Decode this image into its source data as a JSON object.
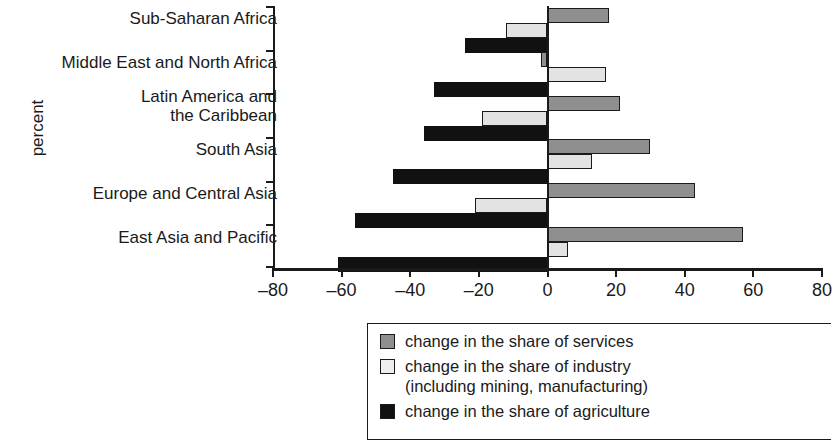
{
  "chart_data": {
    "type": "bar",
    "orientation": "horizontal",
    "title": "",
    "xlabel": "",
    "ylabel": "percent",
    "xlim": [
      -80,
      80
    ],
    "xticks": [
      -80,
      -60,
      -40,
      -20,
      0,
      20,
      40,
      60,
      80
    ],
    "xticklabels": [
      "–80",
      "–60",
      "–40",
      "–20",
      "0",
      "20",
      "40",
      "60",
      "80"
    ],
    "grid": false,
    "legend_position": "bottom",
    "categories": [
      "Sub-Saharan Africa",
      "Middle East and North Africa",
      "Latin America and\nthe Caribbean",
      "South Asia",
      "Europe and Central Asia",
      "East Asia and Pacific"
    ],
    "category_lines": [
      [
        "Sub-Saharan Africa"
      ],
      [
        "Middle East and North Africa"
      ],
      [
        "Latin America and",
        "the Caribbean"
      ],
      [
        "South Asia"
      ],
      [
        "Europe and Central Asia"
      ],
      [
        "East Asia and Pacific"
      ]
    ],
    "series": [
      {
        "name": "change in the share of services",
        "color": "#8f8f8f",
        "values": [
          18,
          -2,
          21,
          30,
          43,
          57
        ]
      },
      {
        "name": "change in the share of industry (including mining, manufacturing)",
        "color": "#e3e3e3",
        "values": [
          -12,
          17,
          -19,
          13,
          -21,
          6
        ]
      },
      {
        "name": "change in the share of agriculture",
        "color": "#111111",
        "values": [
          -24,
          -33,
          -36,
          -45,
          -56,
          -61
        ]
      }
    ]
  },
  "legend": {
    "items": [
      {
        "label": "change in the share of services",
        "label2": "",
        "swatch": "services"
      },
      {
        "label": "change in the share of industry",
        "label2": "(including mining, manufacturing)",
        "swatch": "industry"
      },
      {
        "label": "change in the share of agriculture",
        "label2": "",
        "swatch": "agriculture"
      }
    ]
  },
  "axis": {
    "ylabel": "percent"
  }
}
